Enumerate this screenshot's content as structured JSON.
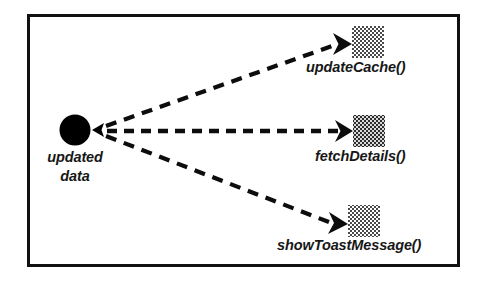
{
  "diagram": {
    "type": "object-notification-diagram",
    "frame": {
      "border_color": "#111111"
    },
    "background_color": "#ffffff",
    "source": {
      "name": "source-node",
      "shape": "filled-circle",
      "color": "#000000",
      "label_line_1": "updated",
      "label_line_2": "data"
    },
    "targets": [
      {
        "name": "updateCache",
        "label": "updateCache()",
        "shape": "dithered-square",
        "color": "#7d7d7d"
      },
      {
        "name": "fetchDetails",
        "label": "fetchDetails()",
        "shape": "dithered-square",
        "color": "#5e5e5e"
      },
      {
        "name": "showToastMessage",
        "label": "showToastMessage()",
        "shape": "dithered-square",
        "color": "#7d7d7d"
      }
    ],
    "connectors": [
      {
        "name": "connector-updateCache",
        "style": "dashed",
        "arrow": "chevron",
        "from": "updated data",
        "to": "updateCache()"
      },
      {
        "name": "connector-fetchDetails",
        "style": "dashed",
        "arrow": "chevron",
        "from": "updated data",
        "to": "fetchDetails()"
      },
      {
        "name": "connector-showToastMessage",
        "style": "dashed",
        "arrow": "chevron",
        "from": "updated data",
        "to": "showToastMessage()"
      }
    ]
  }
}
